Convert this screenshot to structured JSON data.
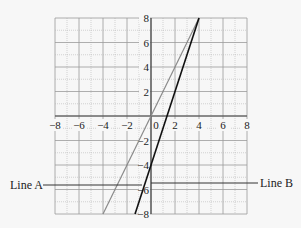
{
  "chart_data": {
    "type": "line",
    "title": "",
    "xlabel": "",
    "ylabel": "",
    "xlim": [
      -8,
      8
    ],
    "ylim": [
      -8,
      8
    ],
    "grid": true,
    "minor_grid": true,
    "x_ticks": [
      -8,
      -6,
      -4,
      -2,
      0,
      2,
      4,
      6,
      8
    ],
    "y_ticks": [
      8,
      6,
      4,
      2,
      -2,
      -4,
      -6,
      -8
    ],
    "x_tick_labels": [
      "−8",
      "−6",
      "−4",
      "−2",
      "0",
      "2",
      "4",
      "6",
      "8"
    ],
    "y_tick_labels": [
      "8",
      "6",
      "4",
      "2",
      "−2",
      "−4",
      "−6",
      "−8"
    ],
    "series": [
      {
        "name": "gray line",
        "color": "#8a8a8a",
        "slope": 2,
        "intercept": 0,
        "x": [
          -4,
          4
        ],
        "y": [
          -8,
          8
        ]
      },
      {
        "name": "black line",
        "color": "#111111",
        "slope": 3,
        "intercept": -4,
        "x": [
          -1.33,
          4
        ],
        "y": [
          -8,
          8
        ]
      }
    ],
    "annotations": [
      {
        "label": "Line A",
        "side": "left",
        "y": -5.5
      },
      {
        "label": "Line B",
        "side": "right",
        "y": -5.5
      }
    ]
  },
  "labels": {
    "line_a": "Line A",
    "line_b": "Line B"
  }
}
